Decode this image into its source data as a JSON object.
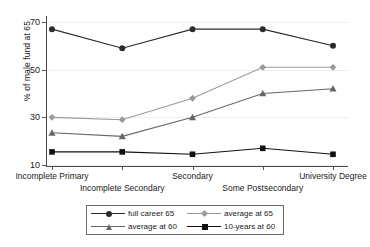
{
  "chart_data": {
    "type": "line",
    "title": "",
    "xlabel": "",
    "ylabel": "% of male fund at 65",
    "categories": [
      "Incomplete Primary",
      "Incomplete Secondary",
      "Secondary",
      "Some Postsecondary",
      "University Degree"
    ],
    "yticks": [
      10,
      30,
      50,
      70
    ],
    "ylim": [
      10,
      72
    ],
    "grid": true,
    "legend_position": "bottom",
    "series": [
      {
        "name": "full career 65",
        "marker": "circle",
        "color": "#2b2b2b",
        "values": [
          67,
          59,
          67,
          67,
          60
        ]
      },
      {
        "name": "average at 65",
        "marker": "diamond",
        "color": "#9a9a9a",
        "values": [
          30,
          29,
          38,
          51,
          51
        ]
      },
      {
        "name": "average at 60",
        "marker": "triangle",
        "color": "#676767",
        "values": [
          23.5,
          22,
          30,
          40,
          42
        ]
      },
      {
        "name": "10-years at 60",
        "marker": "square",
        "color": "#111111",
        "values": [
          15.5,
          15.5,
          14.5,
          17,
          14.5
        ]
      }
    ]
  },
  "axis": {
    "y_title": "% of male fund at 65",
    "y_tick_labels": [
      "70",
      "50",
      "30",
      "10"
    ],
    "x_tick_labels_row1": [
      "Incomplete Primary",
      "Secondary",
      "University Degree"
    ],
    "x_tick_labels_row2": [
      "Incomplete Secondary",
      "Some Postsecondary"
    ]
  },
  "legend": {
    "entries": [
      {
        "label": "full career 65",
        "marker": "circle",
        "color": "#2b2b2b"
      },
      {
        "label": "average at 65",
        "marker": "diamond",
        "color": "#9a9a9a"
      },
      {
        "label": "average at 60",
        "marker": "triangle",
        "color": "#676767"
      },
      {
        "label": "10-years at 60",
        "marker": "square",
        "color": "#111111"
      }
    ]
  }
}
